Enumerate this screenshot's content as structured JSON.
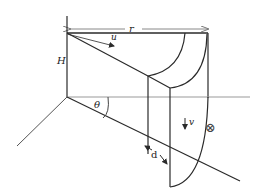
{
  "diagram": {
    "labels": {
      "r": "r",
      "u": "u",
      "H": "H",
      "theta": "θ",
      "v": "v",
      "d": "d",
      "out_of_page_symbol": "⊗"
    },
    "colors": {
      "line": "#2a2a2a",
      "light_line": "#8a8a8a",
      "background": "#ffffff"
    }
  }
}
